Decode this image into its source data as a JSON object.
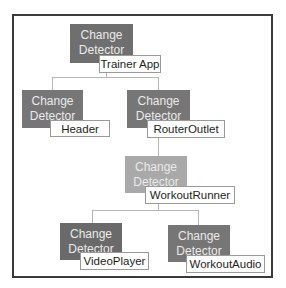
{
  "diagram": {
    "colors": {
      "root": "#6f6f6f",
      "level1": "#767676",
      "workout_runner": "#a9a9a9",
      "level3": "#6a6a6a",
      "frame_border": "#3a3a3a",
      "connector": "#b5b5b5"
    },
    "nodes": [
      {
        "id": "trainer-app",
        "detector_line1": "Change",
        "detector_line2": "Detector",
        "component": "Trainer App"
      },
      {
        "id": "header",
        "detector_line1": "Change",
        "detector_line2": "Detector",
        "component": "Header"
      },
      {
        "id": "router-outlet",
        "detector_line1": "Change",
        "detector_line2": "Detector",
        "component": "RouterOutlet"
      },
      {
        "id": "workout-runner",
        "detector_line1": "Change",
        "detector_line2": "Detector",
        "component": "WorkoutRunner"
      },
      {
        "id": "video-player",
        "detector_line1": "Change",
        "detector_line2": "Detector",
        "component": "VideoPlayer"
      },
      {
        "id": "workout-audio",
        "detector_line1": "Change",
        "detector_line2": "Detector",
        "component": "WorkoutAudio"
      }
    ],
    "edges": [
      [
        "trainer-app",
        "header"
      ],
      [
        "trainer-app",
        "router-outlet"
      ],
      [
        "router-outlet",
        "workout-runner"
      ],
      [
        "workout-runner",
        "video-player"
      ],
      [
        "workout-runner",
        "workout-audio"
      ]
    ]
  }
}
